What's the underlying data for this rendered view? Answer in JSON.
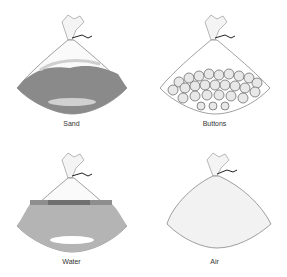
{
  "figure": {
    "panels": [
      {
        "id": "sand",
        "label": "Sand",
        "fill": "#8a8a8a",
        "contents": "sand"
      },
      {
        "id": "buttons",
        "label": "Buttons",
        "fill": "#ffffff",
        "contents": "buttons"
      },
      {
        "id": "water",
        "label": "Water",
        "fill": "#b4b4b4",
        "contents": "water"
      },
      {
        "id": "air",
        "label": "Air",
        "fill": "#f2f2f2",
        "contents": "air"
      }
    ],
    "colors": {
      "outline": "#777777",
      "tie": "#222222"
    }
  }
}
